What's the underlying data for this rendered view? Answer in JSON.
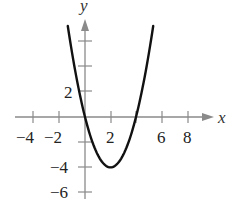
{
  "chart_data": {
    "type": "line",
    "title": "",
    "xlabel": "x",
    "ylabel": "y",
    "function": "y = x^2 - 4x",
    "xlim": [
      -5,
      10
    ],
    "ylim": [
      -6.5,
      9
    ],
    "grid": false,
    "legend": null,
    "x_ticks": [
      -4,
      -2,
      0,
      2,
      4,
      6,
      8
    ],
    "x_tick_labels": [
      "−4",
      "−2",
      "2",
      "6",
      "8"
    ],
    "x_tick_label_values": [
      -4,
      -2,
      2,
      6,
      8
    ],
    "y_ticks": [
      -6,
      -4,
      -2,
      2,
      4,
      6
    ],
    "y_tick_labels": [
      "2",
      "−4",
      "−6"
    ],
    "y_tick_label_values": [
      2,
      -4,
      -6
    ],
    "series": [
      {
        "name": "parabola",
        "x": [
          -1.35,
          -1,
          0,
          1,
          2,
          3,
          4,
          5,
          5.35
        ],
        "values": [
          7.22,
          5,
          0,
          -3,
          -4,
          -3,
          0,
          5,
          7.22
        ]
      }
    ],
    "annotations": {
      "vertex": [
        2,
        -4
      ],
      "x_intercepts": [
        0,
        4
      ]
    }
  },
  "labels": {
    "x_axis": "x",
    "y_axis": "y"
  },
  "colors": {
    "axis": "#8a8a8a",
    "curve": "#111111",
    "text": "#222222"
  }
}
